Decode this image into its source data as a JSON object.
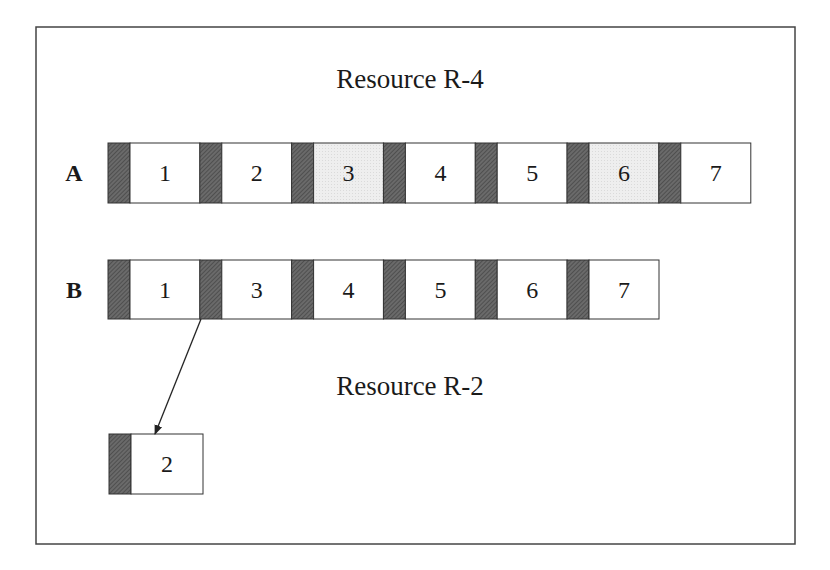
{
  "diagram": {
    "frame": {
      "x": 36,
      "y": 27,
      "width": 759,
      "height": 517
    },
    "colors": {
      "border": "#333333",
      "setup_block": "#5a5a5a",
      "highlight_block": "#ececec",
      "normal_block": "#ffffff"
    },
    "titles": [
      {
        "id": "resource-r4",
        "text": "Resource R-4",
        "x": 410,
        "y": 88
      },
      {
        "id": "resource-r2",
        "text": "Resource R-2",
        "x": 410,
        "y": 395
      }
    ],
    "rows": [
      {
        "label": "A",
        "label_x": 74,
        "y": 143,
        "height": 60,
        "start_x": 108,
        "pitch": 91.8,
        "setup_w": 22,
        "job_w": 70,
        "jobs": [
          {
            "n": "1",
            "highlight": false
          },
          {
            "n": "2",
            "highlight": false
          },
          {
            "n": "3",
            "highlight": true
          },
          {
            "n": "4",
            "highlight": false
          },
          {
            "n": "5",
            "highlight": false
          },
          {
            "n": "6",
            "highlight": true
          },
          {
            "n": "7",
            "highlight": false
          }
        ]
      },
      {
        "label": "B",
        "label_x": 74,
        "y": 260,
        "height": 59,
        "start_x": 108,
        "pitch": 91.8,
        "setup_w": 22,
        "job_w": 70,
        "jobs": [
          {
            "n": "1",
            "highlight": false
          },
          {
            "n": "3",
            "highlight": false
          },
          {
            "n": "4",
            "highlight": false
          },
          {
            "n": "5",
            "highlight": false
          },
          {
            "n": "6",
            "highlight": false
          },
          {
            "n": "7",
            "highlight": false
          }
        ]
      }
    ],
    "r2_row": {
      "y": 434,
      "height": 60,
      "start_x": 109,
      "setup_w": 22,
      "job_w": 72,
      "jobs": [
        {
          "n": "2",
          "highlight": false
        }
      ]
    },
    "arrow": {
      "from": [
        201,
        319
      ],
      "to": [
        155,
        434
      ]
    }
  }
}
